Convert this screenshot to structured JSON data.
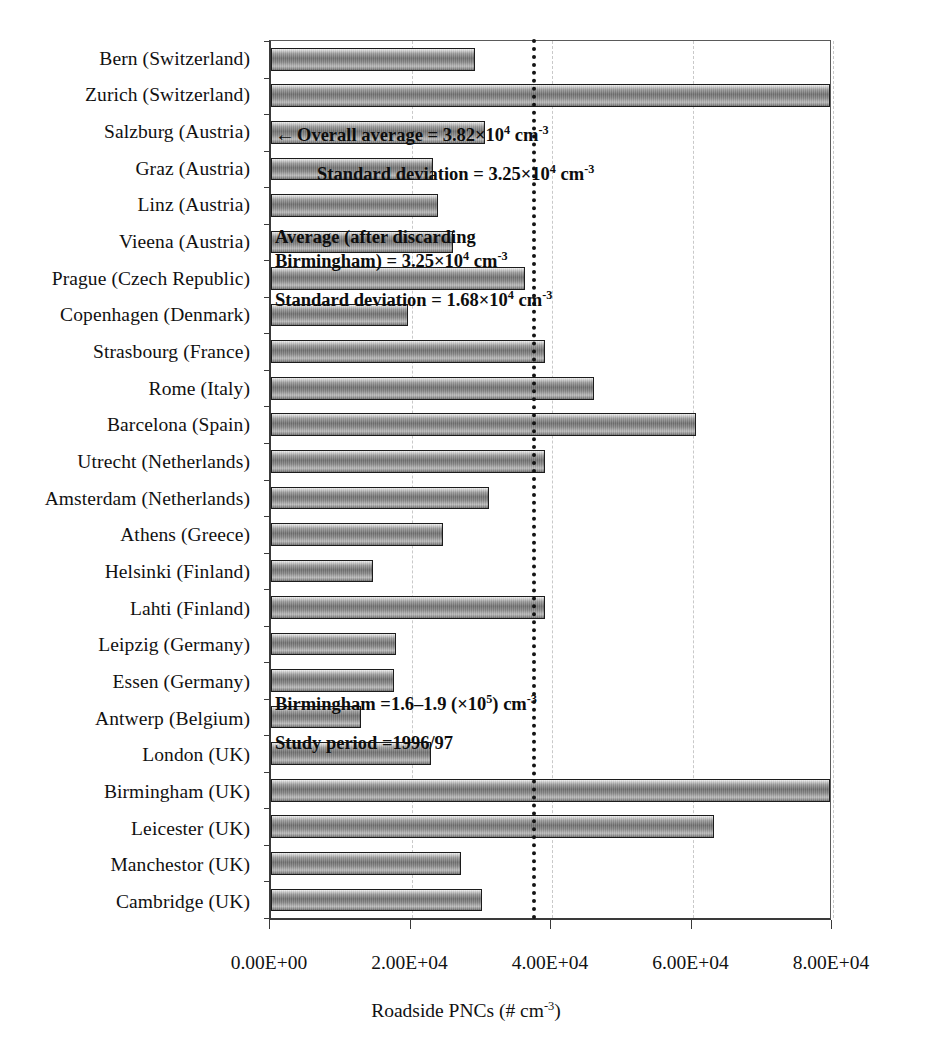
{
  "chart_data": {
    "type": "bar",
    "orientation": "horizontal",
    "title": "",
    "xlabel": "Roadside PNCs (# cm-3)",
    "xlabel_parts": {
      "main": "Roadside PNCs (# cm",
      "sup": "-3",
      "tail": ")"
    },
    "ylabel": "",
    "xlim": [
      0,
      80000
    ],
    "xticks": [
      0,
      20000,
      40000,
      60000,
      80000
    ],
    "xticklabels": [
      "0.00E+00",
      "2.00E+04",
      "4.00E+04",
      "6.00E+04",
      "8.00E+04"
    ],
    "grid": "vertical-dashed",
    "legend": "none",
    "categories": [
      "Bern (Switzerland)",
      "Zurich (Switzerland)",
      "Salzburg (Austria)",
      "Graz (Austria)",
      "Linz (Austria)",
      "Vieena (Austria)",
      "Prague (Czech Republic)",
      "Copenhagen (Denmark)",
      "Strasbourg (France)",
      "Rome (Italy)",
      "Barcelona (Spain)",
      "Utrecht (Netherlands)",
      "Amsterdam (Netherlands)",
      "Athens (Greece)",
      "Helsinki (Finland)",
      "Lahti (Finland)",
      "Leipzig (Germany)",
      "Essen (Germany)",
      "Antwerp (Belgium)",
      "London (UK)",
      "Birmingham (UK)",
      "Leicester (UK)",
      "Manchestor (UK)",
      "Cambridge (UK)"
    ],
    "values": [
      29000,
      80000,
      30500,
      23000,
      23800,
      25900,
      36200,
      19500,
      39000,
      46000,
      60500,
      39000,
      31000,
      24500,
      14500,
      39000,
      17800,
      17500,
      12800,
      22800,
      88000,
      63000,
      27000,
      30000
    ],
    "value_notes": {
      "Birmingham (UK)": "bar extends beyond axis maximum (160000-190000)",
      "Zurich (Switzerland)": "bar reaches axis maximum"
    },
    "reference_line": {
      "value": 37200,
      "style": "dotted",
      "color": "#141414",
      "label": "Overall average"
    }
  },
  "annotations": {
    "overall_average": {
      "arrow": "←",
      "prefix": "Overall average = 3.82×10",
      "sup": "4",
      "unit_main": " cm",
      "unit_sup": "-3"
    },
    "overall_sd": {
      "prefix": "Standard deviation = 3.25×10",
      "sup": "4",
      "unit_main": " cm",
      "unit_sup": "-3"
    },
    "discard_average_line1": "Average (after discarding",
    "discard_average_line2": {
      "prefix": "Birmingham) = 3.25×10",
      "sup": "4",
      "unit_main": " cm",
      "unit_sup": "-3"
    },
    "discard_sd": {
      "prefix": "Standard deviation = 1.68×10",
      "sup": "4",
      "unit_main": " cm",
      "unit_sup": "-3"
    },
    "birmingham_note": {
      "prefix": "Birmingham =1.6–1.9 (×10",
      "sup": "5",
      "unit_main": ") cm",
      "unit_sup": "-3"
    },
    "study_period": "Study period =1996/97"
  },
  "caption": "",
  "colors": {
    "bar_fill_dark": "#6f6f6f",
    "bar_fill_light": "#f2f2f2",
    "bar_border": "#1c1c1c",
    "axis": "#3a3a3a",
    "gridline": "#c9c9c9",
    "reference_line": "#141414",
    "text": "#111111",
    "background": "#ffffff"
  }
}
